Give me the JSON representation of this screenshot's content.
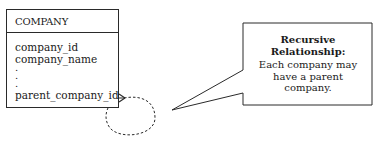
{
  "entity": {
    "name": "COMPANY",
    "attributes": [
      "company_id",
      "company_name"
    ],
    "ellipsis": [
      ".",
      ".",
      "."
    ],
    "foreign_key": "parent_company_id"
  },
  "relationship": {
    "type": "recursive",
    "notation": "crow's foot (many) with dashed self-loop",
    "colors": {
      "line": "#2a2a2a"
    }
  },
  "callout": {
    "title_line1": "Recursive",
    "title_line2": "Relationship:",
    "body_line1": "Each company may",
    "body_line2": "have a parent",
    "body_line3": "company."
  }
}
